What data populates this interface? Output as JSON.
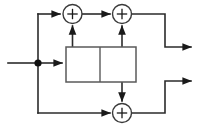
{
  "diagram": {
    "kind": "block-diagram",
    "canvas": {
      "width": 211,
      "height": 128,
      "background": "#ffffff"
    },
    "stroke_color": "#2b2b2b",
    "block_stroke_color": "#5a5a5a",
    "input": {
      "name": "input-signal",
      "label": "",
      "start_x": 8,
      "y": 63
    },
    "junction": {
      "name": "input-branch-node",
      "label": "",
      "x": 38,
      "y": 63,
      "radius": 3.6
    },
    "processing_block": {
      "name": "two-cell-processing-block",
      "label": "",
      "x": 66,
      "y": 47,
      "width": 70,
      "height": 35,
      "divider_x": 100,
      "cells": [
        {
          "name": "left-cell",
          "label": ""
        },
        {
          "name": "right-cell",
          "label": ""
        }
      ]
    },
    "adders": [
      {
        "name": "adder-top-left",
        "label": "+",
        "cx": 72.5,
        "cy": 14,
        "r": 9.5
      },
      {
        "name": "adder-top-right",
        "label": "+",
        "cx": 122,
        "cy": 14,
        "r": 9.5
      },
      {
        "name": "adder-bottom",
        "label": "+",
        "cx": 122,
        "cy": 113,
        "r": 9.5
      }
    ],
    "outputs": [
      {
        "name": "output-upper",
        "label": "",
        "arrow_x": 197,
        "y": 47
      },
      {
        "name": "output-lower",
        "label": "",
        "arrow_x": 197,
        "y": 81
      }
    ],
    "feedback": {
      "name": "feedback-path",
      "top_y": 14,
      "bottom_y": 113,
      "x": 38
    }
  }
}
